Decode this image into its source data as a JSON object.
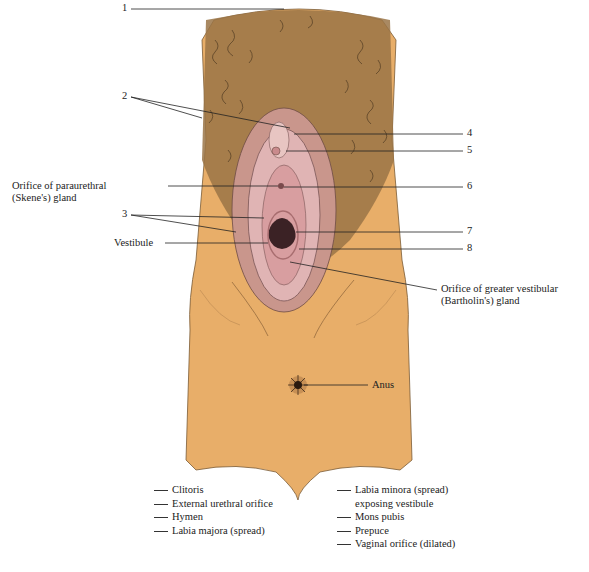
{
  "figure": {
    "colors": {
      "skin": "#E8AE69",
      "hair": "#5a4630",
      "membrane": "#D9A7A9",
      "line": "#333333"
    },
    "callouts": [
      {
        "id": "1",
        "label": "1"
      },
      {
        "id": "2",
        "label": "2"
      },
      {
        "id": "3",
        "label": "3"
      },
      {
        "id": "4",
        "label": "4"
      },
      {
        "id": "5",
        "label": "5"
      },
      {
        "id": "6",
        "label": "6"
      },
      {
        "id": "7",
        "label": "7"
      },
      {
        "id": "8",
        "label": "8"
      }
    ],
    "text_labels": {
      "skene_line1": "Orifice of paraurethral",
      "skene_line2": "(Skene's) gland",
      "vestibule": "Vestibule",
      "bartholin_line1": "Orifice of greater vestibular",
      "bartholin_line2": "(Bartholin's) gland",
      "anus": "Anus"
    }
  },
  "legend": {
    "left": [
      "Clitoris",
      "External urethral orifice",
      "Hymen",
      "Labia majora (spread)"
    ],
    "right": [
      {
        "line1": "Labia minora (spread)",
        "line2": "exposing vestibule"
      },
      {
        "line1": "Mons pubis"
      },
      {
        "line1": "Prepuce"
      },
      {
        "line1": "Vaginal orifice (dilated)"
      }
    ]
  }
}
